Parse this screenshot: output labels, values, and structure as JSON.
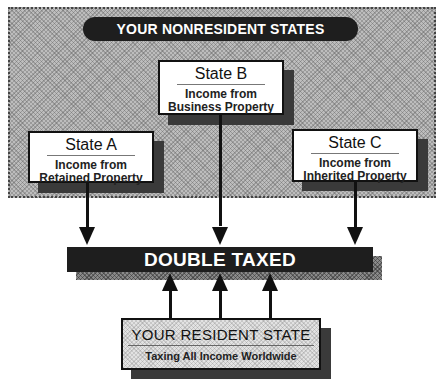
{
  "diagram": {
    "nonresident_region": {
      "title": "YOUR NONRESIDENT STATES"
    },
    "states": [
      {
        "id": "a",
        "title": "State A",
        "line1": "Income from",
        "line2": "Retained Property"
      },
      {
        "id": "b",
        "title": "State B",
        "line1": "Income from",
        "line2": "Business Property"
      },
      {
        "id": "c",
        "title": "State C",
        "line1": "Income from",
        "line2": "Inherited Property"
      }
    ],
    "result": {
      "label": "DOUBLE TAXED"
    },
    "resident": {
      "title": "YOUR RESIDENT STATE",
      "subtitle": "Taxing All Income Worldwide"
    },
    "colors": {
      "dark": "#1e1e1e",
      "region_gray": "#bdbdbd",
      "shadow": "#3a3a3a",
      "box": "#ffffff"
    }
  }
}
